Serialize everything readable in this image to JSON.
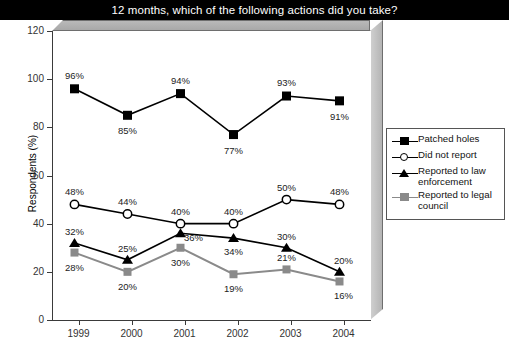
{
  "title": "12 months, which of the following actions did you take?",
  "axis": {
    "ylabel": "Respondents (%)",
    "yticks": [
      "120",
      "100",
      "80",
      "60",
      "40",
      "20",
      "0"
    ],
    "xticks": [
      "1999",
      "2000",
      "2001",
      "2002",
      "2003",
      "2004"
    ]
  },
  "legend": {
    "items": [
      {
        "label": "Patched holes",
        "marker": "filled-square-marker",
        "color": "#000000"
      },
      {
        "label": "Did not report",
        "marker": "open-circle-marker",
        "color": "#000000"
      },
      {
        "label": "Reported to law enforcement",
        "marker": "filled-triangle-marker",
        "color": "#000000"
      },
      {
        "label": "Reported to legal council",
        "marker": "gray-square-marker",
        "color": "#8a8a8a"
      }
    ]
  },
  "chart_data": {
    "type": "line",
    "title": "12 months, which of the following actions did you take?",
    "xlabel": "",
    "ylabel": "Respondents (%)",
    "categories": [
      "1999",
      "2000",
      "2001",
      "2002",
      "2003",
      "2004"
    ],
    "ylim": [
      0,
      120
    ],
    "ytick_step": 20,
    "grid": false,
    "legend_position": "right",
    "series": [
      {
        "name": "Patched holes",
        "marker": "filled-square",
        "color": "#000000",
        "values": [
          96,
          85,
          94,
          77,
          93,
          91
        ],
        "labels": [
          "96%",
          "85%",
          "94%",
          "77%",
          "93%",
          "91%"
        ]
      },
      {
        "name": "Did not report",
        "marker": "open-circle",
        "color": "#000000",
        "values": [
          48,
          44,
          40,
          40,
          50,
          48
        ],
        "labels": [
          "48%",
          "44%",
          "40%",
          "40%",
          "50%",
          "48%"
        ]
      },
      {
        "name": "Reported to law enforcement",
        "marker": "filled-triangle",
        "color": "#000000",
        "values": [
          32,
          25,
          36,
          34,
          30,
          20
        ],
        "labels": [
          "32%",
          "25%",
          "36%",
          "34%",
          "30%",
          "20%"
        ]
      },
      {
        "name": "Reported to legal council",
        "marker": "gray-square",
        "color": "#8a8a8a",
        "values": [
          28,
          20,
          30,
          19,
          21,
          16
        ],
        "labels": [
          "28%",
          "20%",
          "30%",
          "19%",
          "21%",
          "16%"
        ]
      }
    ]
  }
}
